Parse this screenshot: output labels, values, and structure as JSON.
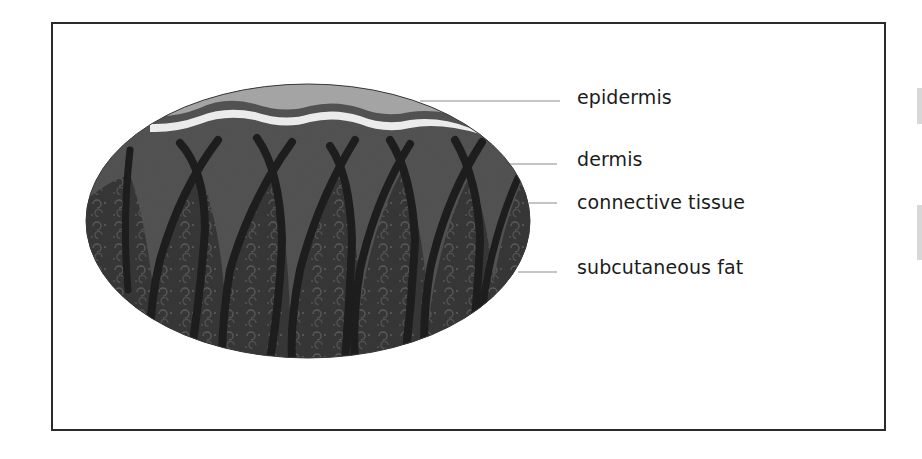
{
  "diagram": {
    "labels": [
      {
        "id": "epidermis",
        "text": "epidermis"
      },
      {
        "id": "dermis",
        "text": "dermis"
      },
      {
        "id": "connective-tissue",
        "text": "connective tissue"
      },
      {
        "id": "subcutaneous-fat",
        "text": "subcutaneous fat"
      }
    ],
    "colors": {
      "frame": "#2b2b2b",
      "epidermis": "#a9a9a9",
      "dermis": "#4a4a4a",
      "subcutaneous_fat": "#2a2a2a",
      "connective_tissue": "#0d0d0d",
      "leader_line": "#8a8a8a",
      "label_text": "#1c1c1c"
    }
  }
}
